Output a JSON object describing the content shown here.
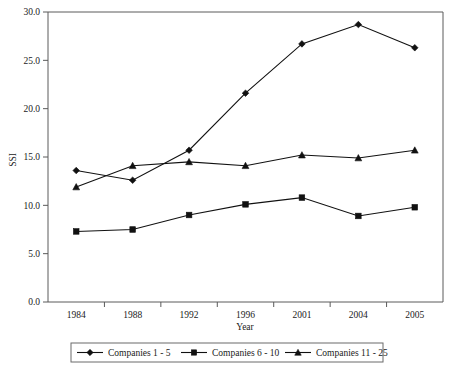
{
  "chart_data": {
    "type": "line",
    "title": "",
    "xlabel": "Year",
    "ylabel": "SSI",
    "categories": [
      "1984",
      "1988",
      "1992",
      "1996",
      "2001",
      "2004",
      "2005"
    ],
    "ylim": [
      0.0,
      30.0
    ],
    "yticks": [
      "0.0",
      "5.0",
      "10.0",
      "15.0",
      "20.0",
      "25.0",
      "30.0"
    ],
    "ytick_values": [
      0.0,
      5.0,
      10.0,
      15.0,
      20.0,
      25.0,
      30.0
    ],
    "grid": false,
    "legend_position": "bottom",
    "series": [
      {
        "name": "Companies 1 - 5",
        "marker": "diamond",
        "color": "#111111",
        "values": [
          13.6,
          12.6,
          15.7,
          21.6,
          26.7,
          28.7,
          26.3
        ]
      },
      {
        "name": "Companies 6 - 10",
        "marker": "square",
        "color": "#111111",
        "values": [
          7.3,
          7.5,
          9.0,
          10.1,
          10.8,
          8.9,
          9.8
        ]
      },
      {
        "name": "Companies 11 - 25",
        "marker": "triangle",
        "color": "#111111",
        "values": [
          11.9,
          14.1,
          14.5,
          14.1,
          15.2,
          14.9,
          15.7
        ]
      }
    ]
  },
  "legend": {
    "items": [
      {
        "label": "Companies 1 - 5",
        "marker": "diamond"
      },
      {
        "label": "Companies 6 - 10",
        "marker": "square"
      },
      {
        "label": "Companies 11 - 25",
        "marker": "triangle"
      }
    ]
  }
}
